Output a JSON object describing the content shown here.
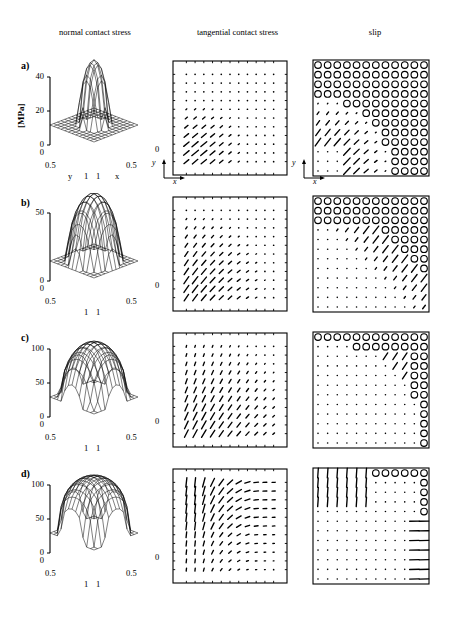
{
  "figure": {
    "columns": [
      {
        "id": "normal",
        "label": "normal contact stress"
      },
      {
        "id": "tangential",
        "label": "tangential contact stress"
      },
      {
        "id": "slip",
        "label": "slip"
      }
    ],
    "rows": [
      {
        "tag": "a)"
      },
      {
        "tag": "b)"
      },
      {
        "tag": "c)"
      },
      {
        "tag": "d)"
      }
    ],
    "unit_label": "[MPa]",
    "base_axis": {
      "x_name": "x",
      "y_name": "y",
      "corner_left": "0",
      "corner_right": "0",
      "mid_left": "0.5",
      "mid_right": "0.5",
      "far_left": "1",
      "far_right": "1"
    },
    "inset_axis": {
      "x": "x",
      "y": "y"
    }
  },
  "chart_data": [
    {
      "type": "surface",
      "panel": "a-normal",
      "title": "normal contact stress",
      "row": "a)",
      "zlabel": "[MPa]",
      "zticks": [
        0,
        20,
        40
      ],
      "zlim": [
        0,
        48
      ],
      "xlabel": "x",
      "ylabel": "y",
      "xticks": [
        0,
        0.5,
        1
      ],
      "yticks": [
        0,
        0.5,
        1
      ],
      "peak": 46,
      "shape": "narrow central hemispherical peak on flat zero plane",
      "grid_n": 13
    },
    {
      "type": "quiver",
      "panel": "a-tangential",
      "title": "tangential contact stress",
      "row": "a)",
      "xlabel": "x",
      "ylabel": "y",
      "grid_n": 11,
      "description": "arrows only in lower-left quadrant pointing up-right, rest dots",
      "max_region": "lower-left"
    },
    {
      "type": "slip-map",
      "panel": "a-slip",
      "title": "slip",
      "row": "a)",
      "xlabel": "x",
      "ylabel": "y",
      "grid_n": 11,
      "description": "open circles (slip) fill most of domain; arrows in lower-left transition band",
      "slip_fraction": 0.72
    },
    {
      "type": "surface",
      "panel": "b-normal",
      "row": "b)",
      "zlabel": "[MPa]",
      "zticks": [
        0,
        50
      ],
      "zlim": [
        0,
        56
      ],
      "xlabel": "x",
      "ylabel": "y",
      "xticks": [
        0,
        0.5,
        1
      ],
      "yticks": [
        0,
        0.5,
        1
      ],
      "peak": 54,
      "shape": "broad tall dome covering most of domain",
      "grid_n": 13
    },
    {
      "type": "quiver",
      "panel": "b-tangential",
      "row": "b)",
      "xlabel": "x",
      "ylabel": "y",
      "grid_n": 11,
      "description": "arrows fill left and lower-left diagonal band pointing up-right",
      "max_region": "left-lower-diagonal"
    },
    {
      "type": "slip-map",
      "panel": "b-slip",
      "row": "b)",
      "xlabel": "x",
      "ylabel": "y",
      "grid_n": 11,
      "description": "circles in upper band and right region, diagonal stick/slip boundary, arrows along boundary",
      "slip_fraction": 0.45
    },
    {
      "type": "surface",
      "panel": "c-normal",
      "row": "c)",
      "zlabel": "[MPa]",
      "zticks": [
        0,
        50,
        100
      ],
      "zlim": [
        0,
        105
      ],
      "xlabel": "x",
      "ylabel": "y",
      "xticks": [
        0,
        0.5,
        1
      ],
      "yticks": [
        0,
        0.5,
        1
      ],
      "peak": 100,
      "shape": "broad rounded dome filling entire domain",
      "grid_n": 13
    },
    {
      "type": "quiver",
      "panel": "c-tangential",
      "row": "c)",
      "xlabel": "x",
      "ylabel": "y",
      "grid_n": 11,
      "description": "arrows across most of domain pointing up-right, largest lower-left",
      "max_region": "broad"
    },
    {
      "type": "slip-map",
      "panel": "c-slip",
      "row": "c)",
      "xlabel": "x",
      "ylabel": "y",
      "grid_n": 11,
      "description": "circles confined to top edge and right edge; interior mostly dots",
      "slip_fraction": 0.18
    },
    {
      "type": "surface",
      "panel": "d-normal",
      "row": "d)",
      "zlabel": "[MPa]",
      "zticks": [
        0,
        50,
        100
      ],
      "zlim": [
        0,
        105
      ],
      "xlabel": "x",
      "ylabel": "y",
      "xticks": [
        0,
        0.5,
        1
      ],
      "yticks": [
        0,
        0.5,
        1
      ],
      "peak": 100,
      "shape": "flat-topped plateau dome filling domain",
      "grid_n": 13
    },
    {
      "type": "quiver",
      "panel": "d-tangential",
      "row": "d)",
      "xlabel": "x",
      "ylabel": "y",
      "grid_n": 11,
      "description": "vertical arrows on left half, horizontal arrows on right half",
      "max_region": "left-vertical-right-horizontal"
    },
    {
      "type": "slip-map",
      "panel": "d-slip",
      "row": "d)",
      "xlabel": "x",
      "ylabel": "y",
      "grid_n": 11,
      "description": "vertical arrows top-left, circles top-right corner, horizontal arrows right edge lower",
      "slip_fraction": 0.12
    }
  ]
}
